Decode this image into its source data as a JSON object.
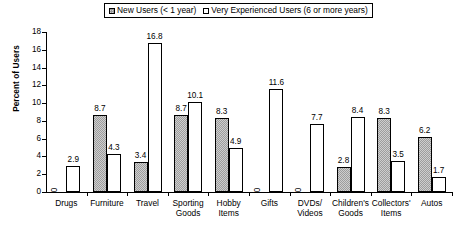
{
  "chart_data": {
    "type": "bar",
    "title": "",
    "xlabel": "",
    "ylabel": "Percent of Users",
    "ylim": [
      0,
      18
    ],
    "yticks": [
      0,
      2,
      4,
      6,
      8,
      10,
      12,
      14,
      16,
      18
    ],
    "grid": false,
    "legend_position": "top",
    "categories": [
      "Drugs",
      "Furniture",
      "Travel",
      "Sporting\nGoods",
      "Hobby\nItems",
      "Gifts",
      "DVDs/\nVideos",
      "Children's\nGoods",
      "Collectors'\nItems",
      "Autos"
    ],
    "series": [
      {
        "name": "New Users (< 1 year)",
        "style": "shaded",
        "values": [
          0,
          8.7,
          3.4,
          8.7,
          8.3,
          0,
          0,
          2.8,
          8.3,
          6.2
        ]
      },
      {
        "name": "Very Experienced Users (6 or more years)",
        "style": "open",
        "values": [
          2.9,
          4.3,
          16.8,
          10.1,
          4.9,
          11.6,
          7.7,
          8.4,
          3.5,
          1.7
        ]
      }
    ]
  },
  "legend": {
    "entries": [
      {
        "label": "New Users (< 1 year)",
        "style": "shaded"
      },
      {
        "label": "Very Experienced Users (6 or more years)",
        "style": "open"
      }
    ]
  },
  "axes": {
    "y_title": "Percent of Users",
    "y_tick_labels": [
      "0",
      "2",
      "4",
      "6",
      "8",
      "10",
      "12",
      "14",
      "16",
      "18"
    ]
  },
  "colors": {
    "shaded_bar": "#9d9d9d",
    "open_bar": "#ffffff",
    "axis": "#000000",
    "text": "#000000",
    "background": "#ffffff"
  }
}
